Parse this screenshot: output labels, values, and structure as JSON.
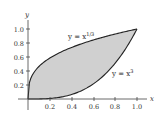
{
  "chart_data": {
    "type": "area",
    "title": "",
    "xlabel": "x",
    "ylabel": "y",
    "xlim": [
      0,
      1.0
    ],
    "ylim": [
      0,
      1.0
    ],
    "grid": false,
    "x_ticks": [
      "0.2",
      "0.4",
      "0.6",
      "0.8",
      "1.0"
    ],
    "y_ticks": [
      "0.2",
      "0.4",
      "0.6",
      "0.8",
      "1.0"
    ],
    "series": [
      {
        "name": "y = x^(1/3)",
        "function": "x^(1/3)",
        "x": [
          0,
          0.2,
          0.4,
          0.6,
          0.8,
          1.0
        ],
        "values": [
          0,
          0.585,
          0.737,
          0.843,
          0.928,
          1.0
        ]
      },
      {
        "name": "y = x^3",
        "function": "x^3",
        "x": [
          0,
          0.2,
          0.4,
          0.6,
          0.8,
          1.0
        ],
        "values": [
          0,
          0.008,
          0.064,
          0.216,
          0.512,
          1.0
        ]
      }
    ],
    "shaded_region": "between y = x^3 and y = x^(1/3) for 0 ≤ x ≤ 1",
    "fill_color": "#d0d0d0",
    "annotations": [
      {
        "text": "y = x^{1/3}",
        "near": [
          0.6,
          0.88
        ]
      },
      {
        "text": "y = x^3",
        "near": [
          0.85,
          0.45
        ]
      }
    ]
  },
  "labels": {
    "x_axis": "x",
    "y_axis": "y",
    "curve_upper": "y = x",
    "curve_upper_exp": "1/3",
    "curve_lower": "y = x",
    "curve_lower_exp": "3",
    "x_tick_0": "0.2",
    "x_tick_1": "0.4",
    "x_tick_2": "0.6",
    "x_tick_3": "0.8",
    "x_tick_4": "1.0",
    "y_tick_0": "0.2",
    "y_tick_1": "0.4",
    "y_tick_2": "0.6",
    "y_tick_3": "0.8",
    "y_tick_4": "1.0"
  }
}
